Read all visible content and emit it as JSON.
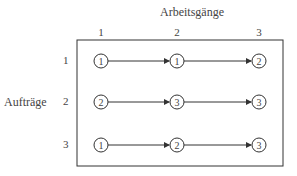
{
  "diagram": {
    "column_axis_title": "Arbeitsgänge",
    "row_axis_title": "Aufträge",
    "columns": [
      "1",
      "2",
      "3"
    ],
    "rows": [
      {
        "label": "1",
        "nodes": [
          "1",
          "1",
          "2"
        ]
      },
      {
        "label": "2",
        "nodes": [
          "2",
          "3",
          "3"
        ]
      },
      {
        "label": "3",
        "nodes": [
          "1",
          "2",
          "3"
        ]
      }
    ],
    "colors": {
      "line": "#333333",
      "text": "#444444",
      "background": "#ffffff"
    }
  }
}
